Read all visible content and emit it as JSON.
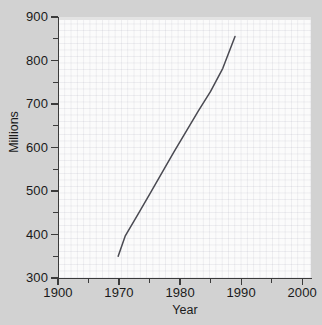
{
  "chart_data": {
    "type": "line",
    "title": "",
    "xlabel": "Year",
    "ylabel": "Millions",
    "xlim": [
      1900,
      2000
    ],
    "ylim": [
      300,
      900
    ],
    "grid": true,
    "legend": null,
    "axis_break": true,
    "x_tick_labels": [
      "1900",
      "1970",
      "1980",
      "1990",
      "2000"
    ],
    "x_tick_values": [
      1900,
      1970,
      1980,
      1990,
      2000
    ],
    "x_minor_ticks": [
      1935,
      1975,
      1985,
      1995
    ],
    "y_tick_labels": [
      "300",
      "400",
      "500",
      "600",
      "700",
      "800",
      "900"
    ],
    "y_tick_values": [
      300,
      400,
      500,
      600,
      700,
      800,
      900
    ],
    "y_minor_ticks": [
      350,
      450,
      550,
      650,
      750,
      850
    ],
    "series": [
      {
        "name": "value",
        "x": [
          1969,
          1971,
          1973,
          1975,
          1977,
          1979,
          1981,
          1983,
          1985,
          1987,
          1989
        ],
        "values": [
          350,
          396,
          444,
          492,
          541,
          590,
          637,
          684,
          729,
          782,
          855
        ]
      }
    ],
    "line_color": "#4a4a52"
  },
  "axes": {
    "y_axis_title": "Millions",
    "x_axis_title": "Year"
  }
}
